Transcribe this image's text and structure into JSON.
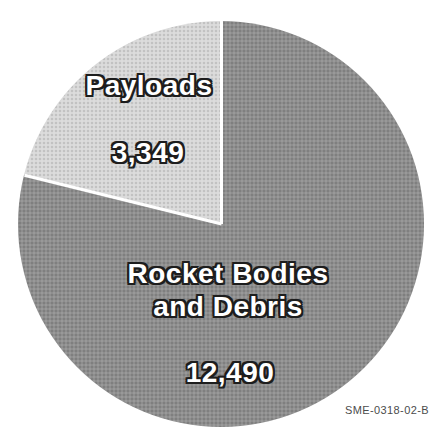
{
  "chart_data": {
    "type": "pie",
    "title": "",
    "legend": "none",
    "first_slice_direction": "counterclockwise-from-12-oclock",
    "slices": [
      {
        "label": "Payloads",
        "value": 3349,
        "display_value": "3,349",
        "color": "#d8d8d8"
      },
      {
        "label": "Rocket Bodies and Debris",
        "label_lines": [
          "Rocket Bodies",
          "and Debris"
        ],
        "value": 12490,
        "display_value": "12,490",
        "color": "#8e8e8e"
      }
    ],
    "label_text_color": "#ffffff",
    "label_outline_color": "#1d1d1d",
    "divider_color": "#ffffff",
    "footnote": "SME-0318-02-B"
  }
}
